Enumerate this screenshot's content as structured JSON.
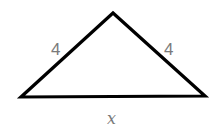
{
  "diagram": {
    "shape": "isosceles-triangle",
    "left_side_label": "4",
    "right_side_label": "4",
    "base_label": "x",
    "stroke_color": "#000000",
    "label_color": "#7a7a7a"
  }
}
